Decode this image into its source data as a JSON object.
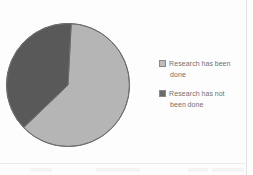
{
  "chart_data": {
    "type": "pie",
    "title": "",
    "subtitle": "",
    "xlabel": "",
    "ylabel": "",
    "grid": false,
    "legend_position": "right",
    "start_angle_deg": 3,
    "categories": [
      "Research has been done",
      "Research has not been done"
    ],
    "values": [
      62,
      38
    ],
    "slices": [
      {
        "label": "Research has been done",
        "value": 62,
        "percent": 62,
        "color": "#b5b5b5",
        "swatch_color": "#bdbdbd"
      },
      {
        "label": "Research has not been done",
        "value": 38,
        "percent": 38,
        "color": "#595959",
        "swatch_color": "#6b6b6b"
      }
    ]
  },
  "legend": {
    "entries": [
      {
        "line1": "Research has been",
        "line2": "done",
        "swatch_color": "#bdbdbd"
      },
      {
        "line1": "Research has not",
        "line2": "been done",
        "swatch_color": "#6b6b6b"
      }
    ]
  },
  "colors": {
    "slice_light": "#b5b5b5",
    "slice_dark": "#595959",
    "outline": "#6e6e6e",
    "legend_text": "#6f6f6f",
    "background": "#fdfdfd"
  }
}
